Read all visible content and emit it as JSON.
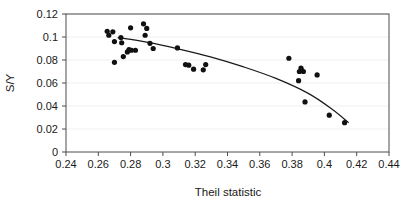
{
  "chart_data": {
    "type": "scatter",
    "title": "",
    "xlabel": "Theil statistic",
    "ylabel": "S/Y",
    "xlim": [
      0.24,
      0.44
    ],
    "ylim": [
      0,
      0.12
    ],
    "xticks": [
      0.24,
      0.26,
      0.28,
      0.3,
      0.32,
      0.34,
      0.36,
      0.38,
      0.4,
      0.42,
      0.44
    ],
    "xticklabels": [
      "0.24",
      "0.26",
      "0.28",
      "0.3",
      "0.32",
      "0.34",
      "0.36",
      "0.38",
      "0.4",
      "0.42",
      "0.44"
    ],
    "yticks": [
      0,
      0.02,
      0.04,
      0.06,
      0.08,
      0.1,
      0.12
    ],
    "yticklabels": [
      "0",
      "0.02",
      "0.04",
      "0.06",
      "0.08",
      "0.1",
      "0.12"
    ],
    "grid": false,
    "legend": null,
    "marker": "filled-circle",
    "marker_color": "#111111",
    "series": [
      {
        "name": "observations",
        "points": [
          [
            0.2655,
            0.105
          ],
          [
            0.2665,
            0.1015
          ],
          [
            0.269,
            0.1045
          ],
          [
            0.27,
            0.096
          ],
          [
            0.27,
            0.078
          ],
          [
            0.274,
            0.0995
          ],
          [
            0.2745,
            0.095
          ],
          [
            0.2755,
            0.083
          ],
          [
            0.278,
            0.087
          ],
          [
            0.279,
            0.089
          ],
          [
            0.28,
            0.108
          ],
          [
            0.2805,
            0.0885
          ],
          [
            0.283,
            0.0885
          ],
          [
            0.288,
            0.1115
          ],
          [
            0.289,
            0.1015
          ],
          [
            0.29,
            0.1075
          ],
          [
            0.292,
            0.0945
          ],
          [
            0.294,
            0.09
          ],
          [
            0.309,
            0.0905
          ],
          [
            0.314,
            0.076
          ],
          [
            0.316,
            0.0755
          ],
          [
            0.319,
            0.072
          ],
          [
            0.325,
            0.0715
          ],
          [
            0.3265,
            0.076
          ],
          [
            0.378,
            0.0815
          ],
          [
            0.384,
            0.062
          ],
          [
            0.3845,
            0.07
          ],
          [
            0.3855,
            0.073
          ],
          [
            0.386,
            0.071
          ],
          [
            0.387,
            0.07
          ],
          [
            0.388,
            0.0435
          ],
          [
            0.3955,
            0.067
          ],
          [
            0.403,
            0.032
          ],
          [
            0.4125,
            0.0255
          ]
        ]
      }
    ],
    "fit_curve": {
      "name": "fitted-trend",
      "points": [
        [
          0.272,
          0.0995
        ],
        [
          0.29,
          0.0955
        ],
        [
          0.31,
          0.0895
        ],
        [
          0.33,
          0.0825
        ],
        [
          0.35,
          0.074
        ],
        [
          0.37,
          0.064
        ],
        [
          0.39,
          0.051
        ],
        [
          0.405,
          0.037
        ],
        [
          0.415,
          0.0255
        ]
      ]
    }
  }
}
